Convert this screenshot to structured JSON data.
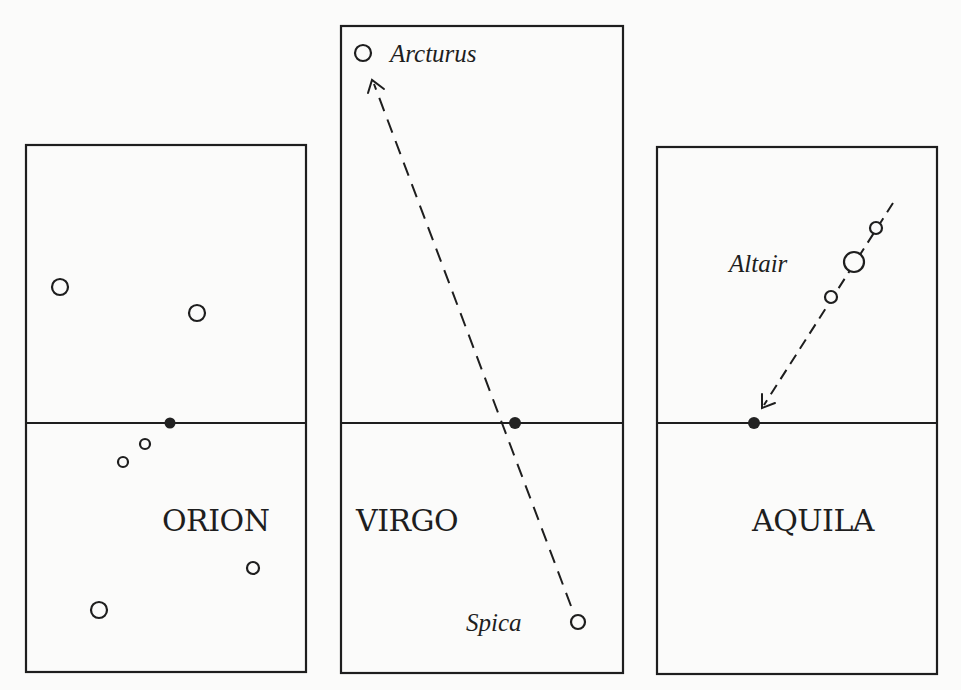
{
  "figure": {
    "panels": [
      {
        "id": "orion",
        "label": "ORION",
        "box": {
          "x": 26,
          "y": 145,
          "w": 280,
          "h": 527
        },
        "horizon_y": 423,
        "zenith_dot": {
          "x": 170,
          "y": 423
        },
        "label_pos": {
          "x": 162,
          "y": 531
        },
        "stars": [
          {
            "x": 60,
            "y": 287,
            "r": 8
          },
          {
            "x": 197,
            "y": 313,
            "r": 8
          },
          {
            "x": 145,
            "y": 444,
            "r": 5
          },
          {
            "x": 123,
            "y": 462,
            "r": 5
          },
          {
            "x": 253,
            "y": 568,
            "r": 6
          },
          {
            "x": 99,
            "y": 610,
            "r": 8
          }
        ]
      },
      {
        "id": "virgo",
        "label": "VIRGO",
        "box": {
          "x": 341,
          "y": 26,
          "w": 282,
          "h": 647
        },
        "horizon_y": 423,
        "zenith_dot": {
          "x": 515,
          "y": 423
        },
        "label_pos": {
          "x": 356,
          "y": 531
        },
        "stars": [
          {
            "name": "Arcturus",
            "x": 363,
            "y": 53,
            "r": 8,
            "label_x": 390,
            "label_y": 62
          },
          {
            "name": "Spica",
            "x": 578,
            "y": 622,
            "r": 7,
            "label_x": 466,
            "label_y": 631
          }
        ],
        "path": {
          "from": {
            "x": 571,
            "y": 606
          },
          "to": {
            "x": 372,
            "y": 80
          },
          "arrow_at": "end"
        }
      },
      {
        "id": "aquila",
        "label": "AQUILA",
        "box": {
          "x": 657,
          "y": 147,
          "w": 280,
          "h": 527
        },
        "horizon_y": 423,
        "zenith_dot": {
          "x": 754,
          "y": 423
        },
        "label_pos": {
          "x": 752,
          "y": 531
        },
        "stars": [
          {
            "x": 876,
            "y": 228,
            "r": 6
          },
          {
            "name": "Altair",
            "x": 854,
            "y": 262,
            "r": 10,
            "label_x": 729,
            "label_y": 272
          },
          {
            "x": 831,
            "y": 297,
            "r": 6
          }
        ],
        "path": {
          "from": {
            "x": 893,
            "y": 203
          },
          "to": {
            "x": 762,
            "y": 408
          },
          "arrow_at": "end"
        }
      }
    ],
    "labels": {
      "orion": "ORION",
      "virgo": "VIRGO",
      "aquila": "AQUILA",
      "arcturus": "Arcturus",
      "spica": "Spica",
      "altair": "Altair"
    }
  }
}
